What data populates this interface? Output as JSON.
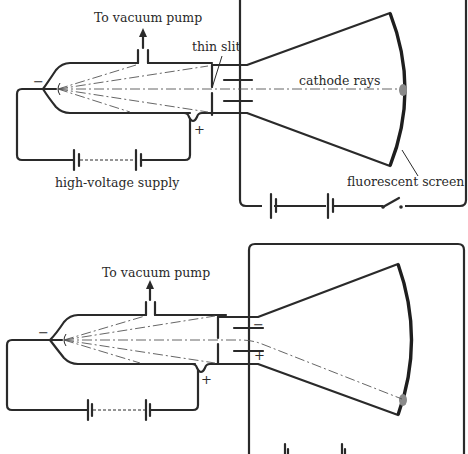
{
  "figure": {
    "panels": [
      {
        "id": "top",
        "description": "Cathode ray tube with no deflection: beam travels straight to center of screen",
        "labels": {
          "pump": "To vacuum pump",
          "slit": "thin slit",
          "rays": "cathode rays",
          "supply": "high-voltage supply",
          "screen": "fluorescent screen"
        },
        "signs": {
          "cathode": "−",
          "anode": "+"
        }
      },
      {
        "id": "bottom",
        "description": "Cathode ray tube with charged deflection plates: beam bends toward positive plate",
        "labels": {
          "pump": "To vacuum pump"
        },
        "signs": {
          "cathode": "−",
          "anode": "+",
          "upper_plate": "−",
          "lower_plate": "+"
        }
      }
    ],
    "colors": {
      "ink": "#2a2a2a",
      "spot": "#8a8a8a",
      "background": "#ffffff"
    }
  }
}
